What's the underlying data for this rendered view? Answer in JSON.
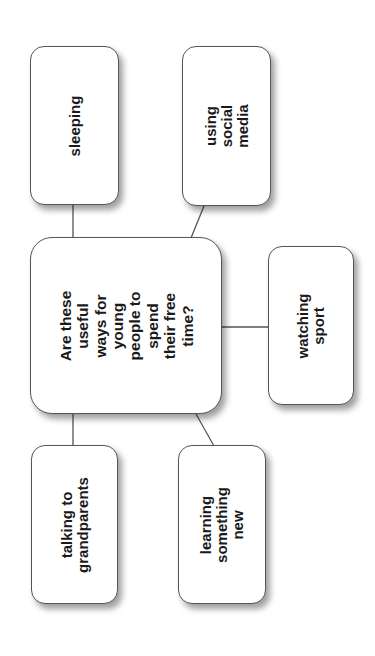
{
  "diagram": {
    "type": "mind-map",
    "orientation": "rotated-90-ccw",
    "colors": {
      "background": "#ffffff",
      "box_border": "#555555",
      "connector": "#555555",
      "text": "#1a1a1a"
    },
    "center": {
      "label": "Are these useful\nways for young\npeople to spend\ntheir free time?"
    },
    "nodes": [
      {
        "id": "sleeping",
        "label": "sleeping"
      },
      {
        "id": "social-media",
        "label": "using social\nmedia"
      },
      {
        "id": "watching-sport",
        "label": "watching sport"
      },
      {
        "id": "grandparents",
        "label": "talking to\ngrandparents"
      },
      {
        "id": "learning",
        "label": "learning\nsomething new"
      }
    ]
  }
}
